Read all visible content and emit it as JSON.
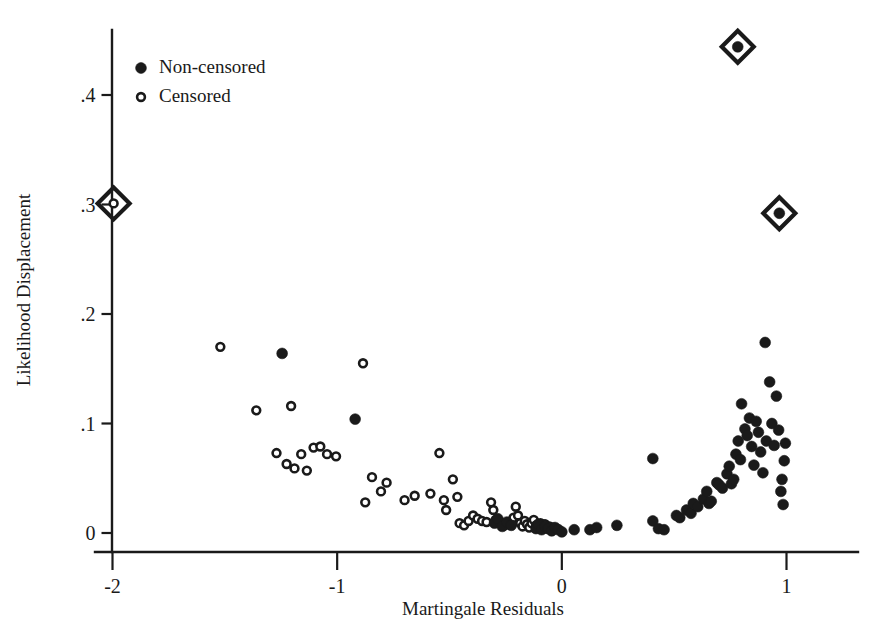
{
  "chart_data": {
    "type": "scatter",
    "title": "",
    "xlabel": "Martingale Residuals",
    "ylabel": "Likelihood Displacement",
    "xlim": [
      -2.22,
      1.06
    ],
    "ylim": [
      -0.012,
      0.475
    ],
    "xticks": [
      -2,
      -1,
      0,
      1
    ],
    "xticklabels": [
      "-2",
      "-1",
      "0",
      "1"
    ],
    "yticks": [
      0,
      0.1,
      0.2,
      0.3,
      0.4
    ],
    "yticklabels": [
      "0",
      ".1",
      ".2",
      ".3",
      ".4"
    ],
    "grid": false,
    "legend_position": "top-left",
    "legend": [
      {
        "label": "Non-censored",
        "marker": "filled-circle"
      },
      {
        "label": "Censored",
        "marker": "open-circle"
      }
    ],
    "series": [
      {
        "name": "Censored",
        "marker": "open-circle",
        "points": [
          [
            -1.52,
            0.17
          ],
          [
            -1.36,
            0.112
          ],
          [
            -1.205,
            0.116
          ],
          [
            -1.27,
            0.073
          ],
          [
            -1.225,
            0.063
          ],
          [
            -1.19,
            0.059
          ],
          [
            -1.16,
            0.072
          ],
          [
            -1.135,
            0.057
          ],
          [
            -1.105,
            0.078
          ],
          [
            -1.075,
            0.079
          ],
          [
            -1.045,
            0.072
          ],
          [
            -1.005,
            0.07
          ],
          [
            -0.885,
            0.155
          ],
          [
            -0.845,
            0.051
          ],
          [
            -0.805,
            0.038
          ],
          [
            -0.78,
            0.046
          ],
          [
            -0.875,
            0.028
          ],
          [
            -0.7,
            0.03
          ],
          [
            -0.655,
            0.034
          ],
          [
            -0.585,
            0.036
          ],
          [
            -0.545,
            0.073
          ],
          [
            -0.525,
            0.03
          ],
          [
            -0.515,
            0.021
          ],
          [
            -0.485,
            0.049
          ],
          [
            -0.465,
            0.033
          ],
          [
            -0.455,
            0.009
          ],
          [
            -0.435,
            0.007
          ],
          [
            -0.415,
            0.011
          ],
          [
            -0.395,
            0.016
          ],
          [
            -0.375,
            0.013
          ],
          [
            -0.355,
            0.011
          ],
          [
            -0.335,
            0.01
          ],
          [
            -0.315,
            0.028
          ],
          [
            -0.305,
            0.021
          ],
          [
            -0.295,
            0.012
          ],
          [
            -0.275,
            0.009
          ],
          [
            -0.255,
            0.007
          ],
          [
            -0.235,
            0.01
          ],
          [
            -0.215,
            0.014
          ],
          [
            -0.205,
            0.024
          ],
          [
            -0.195,
            0.016
          ],
          [
            -0.185,
            0.009
          ],
          [
            -0.175,
            0.006
          ],
          [
            -0.165,
            0.011
          ],
          [
            -0.155,
            0.008
          ],
          [
            -0.145,
            0.005
          ],
          [
            -0.135,
            0.009
          ],
          [
            -0.125,
            0.012
          ],
          [
            -0.115,
            0.007
          ],
          [
            -0.105,
            0.005
          ],
          [
            -0.095,
            0.009
          ],
          [
            -0.085,
            0.006
          ],
          [
            -0.075,
            0.008
          ],
          [
            -0.065,
            0.004
          ],
          [
            -0.055,
            0.006
          ],
          [
            -0.045,
            0.003
          ],
          [
            -0.035,
            0.005
          ]
        ]
      },
      {
        "name": "Non-censored",
        "marker": "filled-circle",
        "points": [
          [
            -1.245,
            0.164
          ],
          [
            -0.92,
            0.104
          ],
          [
            -0.3,
            0.009
          ],
          [
            -0.285,
            0.013
          ],
          [
            -0.265,
            0.006
          ],
          [
            -0.245,
            0.01
          ],
          [
            -0.225,
            0.007
          ],
          [
            -0.115,
            0.004
          ],
          [
            -0.105,
            0.008
          ],
          [
            -0.09,
            0.003
          ],
          [
            -0.075,
            0.006
          ],
          [
            -0.06,
            0.004
          ],
          [
            -0.045,
            0.002
          ],
          [
            -0.03,
            0.005
          ],
          [
            -0.015,
            0.003
          ],
          [
            0.0,
            0.001
          ],
          [
            0.055,
            0.003
          ],
          [
            0.125,
            0.003
          ],
          [
            0.155,
            0.005
          ],
          [
            0.245,
            0.007
          ],
          [
            0.405,
            0.068
          ],
          [
            0.405,
            0.011
          ],
          [
            0.43,
            0.004
          ],
          [
            0.455,
            0.003
          ],
          [
            0.51,
            0.016
          ],
          [
            0.525,
            0.014
          ],
          [
            0.555,
            0.021
          ],
          [
            0.575,
            0.018
          ],
          [
            0.585,
            0.027
          ],
          [
            0.605,
            0.024
          ],
          [
            0.63,
            0.031
          ],
          [
            0.645,
            0.038
          ],
          [
            0.655,
            0.027
          ],
          [
            0.665,
            0.029
          ],
          [
            0.69,
            0.046
          ],
          [
            0.7,
            0.044
          ],
          [
            0.715,
            0.041
          ],
          [
            0.735,
            0.054
          ],
          [
            0.745,
            0.061
          ],
          [
            0.755,
            0.045
          ],
          [
            0.765,
            0.049
          ],
          [
            0.775,
            0.072
          ],
          [
            0.785,
            0.084
          ],
          [
            0.795,
            0.067
          ],
          [
            0.8,
            0.118
          ],
          [
            0.815,
            0.095
          ],
          [
            0.825,
            0.089
          ],
          [
            0.835,
            0.105
          ],
          [
            0.845,
            0.079
          ],
          [
            0.855,
            0.062
          ],
          [
            0.865,
            0.102
          ],
          [
            0.875,
            0.092
          ],
          [
            0.885,
            0.074
          ],
          [
            0.895,
            0.055
          ],
          [
            0.905,
            0.174
          ],
          [
            0.91,
            0.084
          ],
          [
            0.925,
            0.138
          ],
          [
            0.935,
            0.1
          ],
          [
            0.945,
            0.08
          ],
          [
            0.955,
            0.125
          ],
          [
            0.965,
            0.094
          ],
          [
            0.975,
            0.038
          ],
          [
            0.98,
            0.049
          ],
          [
            0.985,
            0.026
          ],
          [
            0.99,
            0.066
          ],
          [
            0.995,
            0.082
          ]
        ]
      }
    ],
    "highlighted": [
      {
        "x": -1.995,
        "y": 0.301,
        "marker": "open-circle",
        "outline": "diamond"
      },
      {
        "x": 0.783,
        "y": 0.444,
        "marker": "filled-circle",
        "outline": "diamond"
      },
      {
        "x": 0.968,
        "y": 0.292,
        "marker": "filled-circle",
        "outline": "diamond"
      }
    ]
  }
}
